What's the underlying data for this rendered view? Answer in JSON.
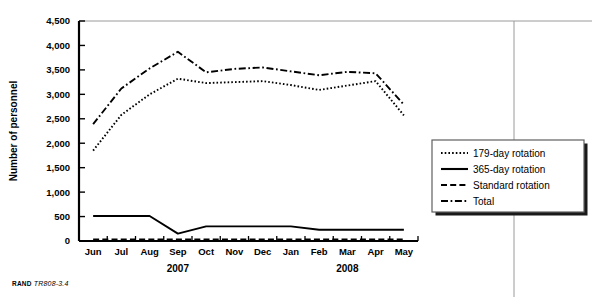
{
  "figure": {
    "credit_org": "RAND",
    "credit_id": "TR808-3.4"
  },
  "chart_data": {
    "type": "line",
    "title": "",
    "xlabel": "",
    "ylabel": "Number of personnel",
    "categories": [
      "Jun",
      "Jul",
      "Aug",
      "Sep",
      "Oct",
      "Nov",
      "Dec",
      "Jan",
      "Feb",
      "Mar",
      "Apr",
      "May"
    ],
    "group_labels": [
      {
        "label": "2007",
        "start_index": 0,
        "end_index": 6
      },
      {
        "label": "2008",
        "start_index": 7,
        "end_index": 11
      }
    ],
    "ylim": [
      0,
      4500
    ],
    "yticks": [
      0,
      500,
      1000,
      1500,
      2000,
      2500,
      3000,
      3500,
      4000,
      4500
    ],
    "ytick_labels": [
      "0",
      "500",
      "1,000",
      "1,500",
      "2,000",
      "2,500",
      "3,000",
      "3,500",
      "4,000",
      "4,500"
    ],
    "grid": false,
    "legend_position": "bottom-right",
    "series": [
      {
        "name": "179-day rotation",
        "style": "dotted",
        "color": "#000000",
        "values": [
          1850,
          2580,
          3000,
          3320,
          3230,
          3250,
          3270,
          3190,
          3090,
          3180,
          3270,
          2570
        ]
      },
      {
        "name": "365-day rotation",
        "style": "solid",
        "color": "#000000",
        "values": [
          510,
          510,
          510,
          150,
          300,
          300,
          300,
          300,
          230,
          230,
          230,
          230
        ]
      },
      {
        "name": "Standard rotation",
        "style": "dashed",
        "color": "#000000",
        "values": [
          30,
          30,
          30,
          30,
          30,
          30,
          30,
          30,
          30,
          30,
          30,
          30
        ]
      },
      {
        "name": "Total",
        "style": "dashdot",
        "color": "#000000",
        "values": [
          2390,
          3120,
          3530,
          3870,
          3450,
          3520,
          3550,
          3470,
          3390,
          3460,
          3430,
          2790
        ]
      }
    ]
  }
}
